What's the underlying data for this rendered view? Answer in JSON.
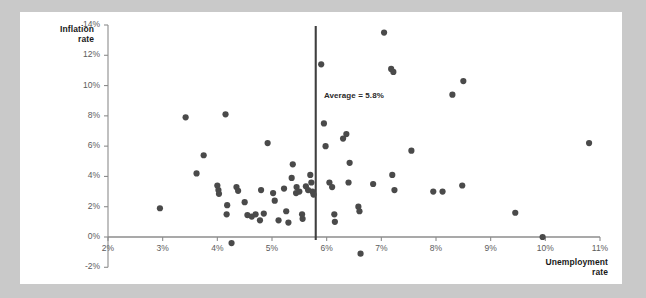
{
  "chart_data": {
    "type": "scatter",
    "title": "",
    "xlabel": "Unemployment rate",
    "ylabel": "Inflation rate",
    "xlim": [
      2,
      11
    ],
    "ylim": [
      -2,
      14
    ],
    "grid": false,
    "legend": null,
    "xticks": [
      "2%",
      "3%",
      "4%",
      "5%",
      "6%",
      "7%",
      "8%",
      "9%",
      "10%",
      "11%"
    ],
    "xtick_values": [
      2,
      3,
      4,
      5,
      6,
      7,
      8,
      9,
      10,
      11
    ],
    "yticks": [
      "-2%",
      "0%",
      "2%",
      "4%",
      "6%",
      "8%",
      "10%",
      "12%",
      "14%"
    ],
    "ytick_values": [
      -2,
      0,
      2,
      4,
      6,
      8,
      10,
      12,
      14
    ],
    "annotations": [
      {
        "text": "Average = 5.8%",
        "x": 5.95,
        "y": 9.3,
        "type": "label"
      }
    ],
    "reference_lines": [
      {
        "orientation": "vertical",
        "value": 5.8,
        "label": "Average = 5.8%",
        "color": "#3f3f3f"
      }
    ],
    "marker_color": "#4a4a4a",
    "marker_size": 3.1,
    "points": [
      {
        "x": 2.95,
        "y": 1.9
      },
      {
        "x": 3.42,
        "y": 7.9
      },
      {
        "x": 3.75,
        "y": 5.4
      },
      {
        "x": 3.62,
        "y": 4.2
      },
      {
        "x": 4.15,
        "y": 8.1
      },
      {
        "x": 4.0,
        "y": 3.4
      },
      {
        "x": 4.02,
        "y": 3.1
      },
      {
        "x": 4.03,
        "y": 2.85
      },
      {
        "x": 4.18,
        "y": 2.1
      },
      {
        "x": 4.17,
        "y": 1.5
      },
      {
        "x": 4.26,
        "y": -0.4
      },
      {
        "x": 4.35,
        "y": 3.3
      },
      {
        "x": 4.38,
        "y": 3.05
      },
      {
        "x": 4.5,
        "y": 2.3
      },
      {
        "x": 4.55,
        "y": 1.45
      },
      {
        "x": 4.63,
        "y": 1.35
      },
      {
        "x": 4.7,
        "y": 1.5
      },
      {
        "x": 4.78,
        "y": 1.1
      },
      {
        "x": 4.8,
        "y": 3.1
      },
      {
        "x": 4.85,
        "y": 1.55
      },
      {
        "x": 4.92,
        "y": 6.2
      },
      {
        "x": 5.05,
        "y": 2.4
      },
      {
        "x": 5.02,
        "y": 2.9
      },
      {
        "x": 5.12,
        "y": 1.1
      },
      {
        "x": 5.22,
        "y": 3.2
      },
      {
        "x": 5.26,
        "y": 1.7
      },
      {
        "x": 5.3,
        "y": 0.95
      },
      {
        "x": 5.36,
        "y": 3.9
      },
      {
        "x": 5.38,
        "y": 4.8
      },
      {
        "x": 5.45,
        "y": 3.3
      },
      {
        "x": 5.44,
        "y": 2.9
      },
      {
        "x": 5.5,
        "y": 3.0
      },
      {
        "x": 5.55,
        "y": 1.5
      },
      {
        "x": 5.56,
        "y": 1.2
      },
      {
        "x": 5.62,
        "y": 3.35
      },
      {
        "x": 5.66,
        "y": 3.1
      },
      {
        "x": 5.7,
        "y": 4.1
      },
      {
        "x": 5.72,
        "y": 3.6
      },
      {
        "x": 5.74,
        "y": 3.0
      },
      {
        "x": 5.76,
        "y": 2.8
      },
      {
        "x": 5.9,
        "y": 11.4
      },
      {
        "x": 5.95,
        "y": 7.5
      },
      {
        "x": 5.98,
        "y": 6.0
      },
      {
        "x": 6.05,
        "y": 3.6
      },
      {
        "x": 6.1,
        "y": 3.3
      },
      {
        "x": 6.14,
        "y": 1.5
      },
      {
        "x": 6.15,
        "y": 1.0
      },
      {
        "x": 6.3,
        "y": 6.5
      },
      {
        "x": 6.36,
        "y": 6.8
      },
      {
        "x": 6.4,
        "y": 3.6
      },
      {
        "x": 6.42,
        "y": 4.9
      },
      {
        "x": 6.58,
        "y": 2.0
      },
      {
        "x": 6.6,
        "y": 1.7
      },
      {
        "x": 6.62,
        "y": -1.1
      },
      {
        "x": 6.85,
        "y": 3.5
      },
      {
        "x": 7.05,
        "y": 13.5
      },
      {
        "x": 7.18,
        "y": 11.1
      },
      {
        "x": 7.22,
        "y": 10.9
      },
      {
        "x": 7.2,
        "y": 4.1
      },
      {
        "x": 7.24,
        "y": 3.1
      },
      {
        "x": 7.55,
        "y": 5.7
      },
      {
        "x": 7.95,
        "y": 3.0
      },
      {
        "x": 8.3,
        "y": 9.4
      },
      {
        "x": 8.12,
        "y": 3.0
      },
      {
        "x": 8.5,
        "y": 10.3
      },
      {
        "x": 8.48,
        "y": 3.4
      },
      {
        "x": 9.45,
        "y": 1.6
      },
      {
        "x": 9.95,
        "y": 0.0
      },
      {
        "x": 10.8,
        "y": 6.2
      }
    ]
  },
  "axes": {
    "y_title": "Inflation\nrate",
    "y_title_line1": "Inflation",
    "y_title_line2": "rate",
    "x_title_line1": "Unemployment",
    "x_title_line2": "rate"
  }
}
